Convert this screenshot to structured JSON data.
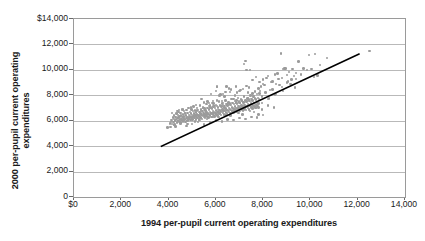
{
  "chart_data": {
    "type": "scatter",
    "title": "",
    "xlabel": "1994 per-pupil current operating expenditures",
    "ylabel": "2000 per-pupil current operating expenditures",
    "ylabel_line1": "2000 per-pupil current operating",
    "ylabel_line2": "expenditures",
    "xlim": [
      0,
      14000
    ],
    "ylim": [
      0,
      14000
    ],
    "grid": "horizontal",
    "legend": "none",
    "marker_color": "#9b9b9b",
    "trendline_color": "#000000",
    "axis_color": "#9a9a9a",
    "gridline_color": "#b9b9b9",
    "xticks": [
      {
        "value": 0,
        "label": "$0"
      },
      {
        "value": 2000,
        "label": "2,000"
      },
      {
        "value": 4000,
        "label": "4,000"
      },
      {
        "value": 6000,
        "label": "6,000"
      },
      {
        "value": 8000,
        "label": "8,000"
      },
      {
        "value": 10000,
        "label": "10,000"
      },
      {
        "value": 12000,
        "label": "12,000"
      },
      {
        "value": 14000,
        "label": "14,000"
      }
    ],
    "yticks": [
      {
        "value": 0,
        "label": "0"
      },
      {
        "value": 2000,
        "label": "2,000"
      },
      {
        "value": 4000,
        "label": "4,000"
      },
      {
        "value": 6000,
        "label": "6,000"
      },
      {
        "value": 8000,
        "label": "8,000"
      },
      {
        "value": 10000,
        "label": "10,000"
      },
      {
        "value": 12000,
        "label": "12,000"
      },
      {
        "value": 14000,
        "label": "$14,000"
      }
    ],
    "trendline": {
      "label": "reference line",
      "x0": 3700,
      "y0": 4000,
      "x1": 12050,
      "y1": 11250
    },
    "points": [
      [
        3960,
        5450
      ],
      [
        4050,
        5800
      ],
      [
        4080,
        5500
      ],
      [
        4120,
        6050
      ],
      [
        4150,
        5750
      ],
      [
        4180,
        6250
      ],
      [
        4200,
        5900
      ],
      [
        4220,
        6150
      ],
      [
        4240,
        6400
      ],
      [
        4260,
        5650
      ],
      [
        4280,
        6000
      ],
      [
        4300,
        6300
      ],
      [
        4320,
        6100
      ],
      [
        4340,
        6550
      ],
      [
        4350,
        5850
      ],
      [
        4370,
        6200
      ],
      [
        4390,
        6450
      ],
      [
        4400,
        6000
      ],
      [
        4410,
        6700
      ],
      [
        4430,
        6250
      ],
      [
        4450,
        5950
      ],
      [
        4460,
        6350
      ],
      [
        4480,
        6100
      ],
      [
        4500,
        6600
      ],
      [
        4510,
        5800
      ],
      [
        4530,
        6400
      ],
      [
        4550,
        6150
      ],
      [
        4560,
        6900
      ],
      [
        4580,
        6300
      ],
      [
        4600,
        6050
      ],
      [
        4610,
        6500
      ],
      [
        4630,
        6200
      ],
      [
        4650,
        6750
      ],
      [
        4660,
        6350
      ],
      [
        4680,
        6100
      ],
      [
        4700,
        6550
      ],
      [
        4710,
        5900
      ],
      [
        4730,
        6400
      ],
      [
        4750,
        6200
      ],
      [
        4760,
        6850
      ],
      [
        4780,
        6300
      ],
      [
        4800,
        6000
      ],
      [
        4810,
        6600
      ],
      [
        4830,
        6250
      ],
      [
        4850,
        7000
      ],
      [
        4860,
        6450
      ],
      [
        4880,
        6150
      ],
      [
        4900,
        6700
      ],
      [
        4910,
        6350
      ],
      [
        4930,
        6050
      ],
      [
        4950,
        6550
      ],
      [
        4960,
        6900
      ],
      [
        4980,
        6250
      ],
      [
        5000,
        6450
      ],
      [
        5010,
        6100
      ],
      [
        5030,
        6750
      ],
      [
        5050,
        6350
      ],
      [
        5060,
        7100
      ],
      [
        5080,
        6550
      ],
      [
        5100,
        6200
      ],
      [
        5110,
        6800
      ],
      [
        5130,
        6400
      ],
      [
        5150,
        6100
      ],
      [
        5160,
        6650
      ],
      [
        5180,
        6300
      ],
      [
        5200,
        7000
      ],
      [
        5210,
        6500
      ],
      [
        5230,
        6200
      ],
      [
        5250,
        6850
      ],
      [
        5260,
        6400
      ],
      [
        5280,
        6100
      ],
      [
        5300,
        6700
      ],
      [
        5310,
        6350
      ],
      [
        5330,
        7200
      ],
      [
        5350,
        6550
      ],
      [
        5360,
        6250
      ],
      [
        5380,
        6900
      ],
      [
        5400,
        6450
      ],
      [
        5410,
        6150
      ],
      [
        5430,
        6750
      ],
      [
        5450,
        6400
      ],
      [
        5460,
        7050
      ],
      [
        5480,
        6600
      ],
      [
        5500,
        6300
      ],
      [
        5510,
        6950
      ],
      [
        5530,
        6500
      ],
      [
        5550,
        6200
      ],
      [
        5560,
        6800
      ],
      [
        5580,
        6450
      ],
      [
        5600,
        7300
      ],
      [
        5610,
        6650
      ],
      [
        5630,
        6350
      ],
      [
        5650,
        7000
      ],
      [
        5660,
        6550
      ],
      [
        5680,
        6250
      ],
      [
        5700,
        6900
      ],
      [
        5710,
        6500
      ],
      [
        5730,
        7150
      ],
      [
        5750,
        6700
      ],
      [
        5760,
        6400
      ],
      [
        5780,
        7050
      ],
      [
        5800,
        6600
      ],
      [
        5810,
        6300
      ],
      [
        5830,
        6950
      ],
      [
        5850,
        6550
      ],
      [
        5860,
        7400
      ],
      [
        5880,
        6750
      ],
      [
        5900,
        6450
      ],
      [
        5910,
        7100
      ],
      [
        5930,
        6650
      ],
      [
        5950,
        6350
      ],
      [
        5960,
        7000
      ],
      [
        5980,
        6600
      ],
      [
        6000,
        7250
      ],
      [
        6010,
        6800
      ],
      [
        6030,
        6500
      ],
      [
        6050,
        7150
      ],
      [
        6060,
        6700
      ],
      [
        6080,
        6400
      ],
      [
        6100,
        7050
      ],
      [
        6110,
        6650
      ],
      [
        6130,
        7500
      ],
      [
        6150,
        6850
      ],
      [
        6160,
        6550
      ],
      [
        6180,
        7200
      ],
      [
        6200,
        6750
      ],
      [
        6210,
        6450
      ],
      [
        6230,
        7100
      ],
      [
        6250,
        6700
      ],
      [
        6260,
        7350
      ],
      [
        6280,
        6900
      ],
      [
        6300,
        6600
      ],
      [
        6310,
        7250
      ],
      [
        6330,
        6800
      ],
      [
        6350,
        6500
      ],
      [
        6360,
        7150
      ],
      [
        6380,
        6750
      ],
      [
        6400,
        7600
      ],
      [
        6410,
        6950
      ],
      [
        6430,
        6650
      ],
      [
        6450,
        7300
      ],
      [
        6460,
        6850
      ],
      [
        6480,
        6550
      ],
      [
        6500,
        7200
      ],
      [
        6510,
        6800
      ],
      [
        6530,
        7450
      ],
      [
        6550,
        7000
      ],
      [
        6560,
        6700
      ],
      [
        6580,
        7350
      ],
      [
        6600,
        6900
      ],
      [
        6610,
        6600
      ],
      [
        6630,
        7250
      ],
      [
        6650,
        6850
      ],
      [
        6660,
        7700
      ],
      [
        6680,
        7050
      ],
      [
        6700,
        6750
      ],
      [
        6710,
        7400
      ],
      [
        6730,
        6950
      ],
      [
        6750,
        6650
      ],
      [
        6760,
        7300
      ],
      [
        6780,
        6900
      ],
      [
        6800,
        7550
      ],
      [
        6810,
        7100
      ],
      [
        6830,
        6800
      ],
      [
        6850,
        7450
      ],
      [
        6860,
        7000
      ],
      [
        6880,
        6700
      ],
      [
        6900,
        7350
      ],
      [
        6910,
        6950
      ],
      [
        6930,
        7800
      ],
      [
        6950,
        7150
      ],
      [
        6960,
        6850
      ],
      [
        6980,
        7500
      ],
      [
        7000,
        7050
      ],
      [
        7010,
        6750
      ],
      [
        7030,
        7400
      ],
      [
        7050,
        7000
      ],
      [
        7060,
        7650
      ],
      [
        7080,
        7200
      ],
      [
        7100,
        6900
      ],
      [
        7110,
        7550
      ],
      [
        7130,
        7100
      ],
      [
        7150,
        6800
      ],
      [
        7160,
        7450
      ],
      [
        7180,
        7050
      ],
      [
        7200,
        7900
      ],
      [
        7210,
        7250
      ],
      [
        7230,
        6950
      ],
      [
        7250,
        7600
      ],
      [
        7260,
        7150
      ],
      [
        7280,
        6850
      ],
      [
        7300,
        7500
      ],
      [
        7310,
        7100
      ],
      [
        7330,
        7750
      ],
      [
        7350,
        7300
      ],
      [
        7360,
        7000
      ],
      [
        7380,
        7650
      ],
      [
        7400,
        7200
      ],
      [
        7410,
        6900
      ],
      [
        7430,
        7550
      ],
      [
        7450,
        7150
      ],
      [
        7460,
        8000
      ],
      [
        7480,
        7350
      ],
      [
        7500,
        7050
      ],
      [
        7510,
        7700
      ],
      [
        7530,
        7250
      ],
      [
        7550,
        6950
      ],
      [
        7560,
        7600
      ],
      [
        7580,
        7200
      ],
      [
        7600,
        7850
      ],
      [
        7610,
        7400
      ],
      [
        7630,
        7100
      ],
      [
        7650,
        7750
      ],
      [
        7660,
        7300
      ],
      [
        7680,
        7000
      ],
      [
        7700,
        7650
      ],
      [
        7710,
        7250
      ],
      [
        7730,
        8100
      ],
      [
        7750,
        7450
      ],
      [
        7760,
        7150
      ],
      [
        7780,
        7800
      ],
      [
        7800,
        7350
      ],
      [
        7810,
        7050
      ],
      [
        7830,
        7700
      ],
      [
        4150,
        6600
      ],
      [
        4380,
        6750
      ],
      [
        4620,
        6900
      ],
      [
        4870,
        6250
      ],
      [
        5120,
        5950
      ],
      [
        5370,
        6750
      ],
      [
        5620,
        6150
      ],
      [
        5870,
        7550
      ],
      [
        6120,
        6300
      ],
      [
        6370,
        7900
      ],
      [
        6620,
        6400
      ],
      [
        6870,
        7600
      ],
      [
        7120,
        6500
      ],
      [
        7370,
        8200
      ],
      [
        7620,
        6700
      ],
      [
        7870,
        8350
      ],
      [
        4250,
        5700
      ],
      [
        4500,
        5850
      ],
      [
        4750,
        5600
      ],
      [
        5000,
        5750
      ],
      [
        5250,
        5900
      ],
      [
        5500,
        5700
      ],
      [
        5750,
        5850
      ],
      [
        6000,
        6000
      ],
      [
        6250,
        5950
      ],
      [
        6500,
        6100
      ],
      [
        6750,
        6050
      ],
      [
        7000,
        6200
      ],
      [
        7250,
        6150
      ],
      [
        7500,
        6300
      ],
      [
        7750,
        6250
      ],
      [
        8000,
        6450
      ],
      [
        5400,
        7700
      ],
      [
        5650,
        7500
      ],
      [
        5900,
        7350
      ],
      [
        6150,
        8000
      ],
      [
        6400,
        8250
      ],
      [
        6650,
        8450
      ],
      [
        6900,
        8200
      ],
      [
        7150,
        8500
      ],
      [
        7400,
        8600
      ],
      [
        7650,
        8300
      ],
      [
        7900,
        8700
      ],
      [
        6050,
        8650
      ],
      [
        6300,
        8100
      ],
      [
        6550,
        8550
      ],
      [
        6800,
        8000
      ],
      [
        7050,
        8400
      ],
      [
        7300,
        8750
      ],
      [
        7550,
        8150
      ],
      [
        7800,
        8550
      ],
      [
        8050,
        8800
      ],
      [
        8300,
        8400
      ],
      [
        8550,
        8900
      ],
      [
        8800,
        8650
      ],
      [
        9050,
        9100
      ],
      [
        7950,
        7900
      ],
      [
        8100,
        8200
      ],
      [
        8250,
        7750
      ],
      [
        8400,
        8450
      ],
      [
        8550,
        8100
      ],
      [
        8700,
        8800
      ],
      [
        8850,
        8350
      ],
      [
        9000,
        9000
      ],
      [
        8000,
        9250
      ],
      [
        8200,
        9500
      ],
      [
        8400,
        9100
      ],
      [
        8600,
        9700
      ],
      [
        8800,
        9350
      ],
      [
        9000,
        9600
      ],
      [
        9200,
        9250
      ],
      [
        9400,
        9750
      ],
      [
        7300,
        10000
      ],
      [
        7450,
        10000
      ],
      [
        7250,
        10700
      ],
      [
        7200,
        10450
      ],
      [
        7550,
        9200
      ],
      [
        7700,
        9450
      ],
      [
        7850,
        9050
      ],
      [
        8000,
        8900
      ],
      [
        8150,
        9350
      ],
      [
        8350,
        9050
      ],
      [
        8500,
        9650
      ],
      [
        8650,
        9300
      ],
      [
        8850,
        10050
      ],
      [
        8900,
        10100
      ],
      [
        9100,
        9850
      ],
      [
        9300,
        9500
      ],
      [
        6050,
        8700
      ],
      [
        6450,
        8700
      ],
      [
        6850,
        8700
      ],
      [
        5800,
        8100
      ],
      [
        6000,
        8350
      ],
      [
        6200,
        8050
      ],
      [
        6600,
        8250
      ],
      [
        7000,
        8350
      ],
      [
        8750,
        11300
      ],
      [
        9500,
        10650
      ],
      [
        9950,
        11150
      ],
      [
        10200,
        11250
      ],
      [
        10400,
        10400
      ],
      [
        10700,
        10950
      ],
      [
        10150,
        9450
      ],
      [
        10050,
        10050
      ],
      [
        9700,
        10100
      ],
      [
        9250,
        10050
      ],
      [
        9400,
        9300
      ],
      [
        9600,
        9650
      ],
      [
        9850,
        10000
      ],
      [
        10300,
        9550
      ],
      [
        12500,
        11500
      ],
      [
        7800,
        6500
      ],
      [
        8950,
        10100
      ],
      [
        9150,
        8900
      ],
      [
        9350,
        8600
      ],
      [
        8500,
        8050
      ],
      [
        8200,
        7700
      ],
      [
        7950,
        7400
      ],
      [
        4100,
        5900
      ],
      [
        4300,
        5550
      ],
      [
        4550,
        6050
      ],
      [
        4800,
        5750
      ],
      [
        5050,
        6300
      ],
      [
        5300,
        6050
      ],
      [
        5550,
        6350
      ],
      [
        5800,
        6550
      ],
      [
        6100,
        6850
      ],
      [
        6350,
        7050
      ],
      [
        6600,
        7250
      ],
      [
        6850,
        7400
      ],
      [
        7100,
        7600
      ],
      [
        7350,
        7750
      ],
      [
        7600,
        7950
      ],
      [
        7850,
        8150
      ],
      [
        5150,
        7250
      ],
      [
        5450,
        7000
      ],
      [
        5700,
        7400
      ],
      [
        5950,
        7150
      ],
      [
        6250,
        7550
      ],
      [
        6500,
        7300
      ],
      [
        6750,
        7700
      ],
      [
        7000,
        7450
      ],
      [
        4450,
        6850
      ],
      [
        4700,
        6600
      ],
      [
        4950,
        7050
      ],
      [
        5200,
        6800
      ],
      [
        5500,
        7450
      ],
      [
        5750,
        7200
      ],
      [
        6050,
        7600
      ],
      [
        6300,
        7400
      ],
      [
        4600,
        5950
      ],
      [
        4850,
        6150
      ],
      [
        5100,
        6400
      ],
      [
        5350,
        6200
      ],
      [
        5600,
        6500
      ],
      [
        5850,
        6300
      ],
      [
        6150,
        6600
      ],
      [
        6400,
        6450
      ],
      [
        6700,
        6750
      ],
      [
        6950,
        6600
      ],
      [
        7200,
        6900
      ],
      [
        7450,
        6750
      ],
      [
        7700,
        7050
      ],
      [
        7950,
        6900
      ],
      [
        8200,
        7200
      ],
      [
        8450,
        7050
      ]
    ]
  }
}
